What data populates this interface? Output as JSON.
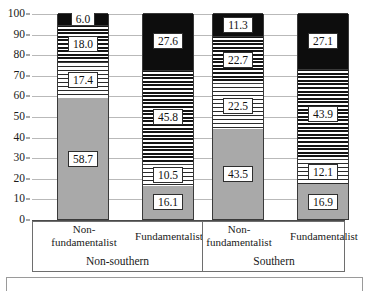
{
  "chart_data": {
    "type": "bar",
    "subtype": "stacked-100-percent",
    "title": "",
    "xlabel": "",
    "ylabel": "",
    "ylim": [
      0,
      100
    ],
    "ytick_step": 10,
    "yticks": [
      "0",
      "10",
      "20",
      "30",
      "40",
      "50",
      "60",
      "70",
      "80",
      "90",
      "100"
    ],
    "grid": true,
    "legend": "none-visible",
    "categories": [
      "Non-fundamentalist",
      "Fundamentalist",
      "Non-fundamentalist",
      "Fundamentalist"
    ],
    "group_labels": [
      "Non-southern",
      "Southern"
    ],
    "series": [
      {
        "name": "segment-1-solid-gray",
        "pattern": "solid-gray",
        "color": "#a9a9a9",
        "values": [
          58.7,
          16.1,
          43.5,
          16.9
        ]
      },
      {
        "name": "segment-2-light-hatch",
        "pattern": "light-hatch",
        "color": "#ffffff",
        "values": [
          17.4,
          10.5,
          22.5,
          12.1
        ]
      },
      {
        "name": "segment-3-dense-hatch",
        "pattern": "dense-hatch",
        "color": "#ffffff",
        "values": [
          18.0,
          45.8,
          22.7,
          43.9
        ]
      },
      {
        "name": "segment-4-solid-black",
        "pattern": "solid-black",
        "color": "#0d0d0d",
        "values": [
          6.0,
          27.6,
          11.3,
          27.1
        ]
      }
    ],
    "bars": [
      {
        "category": "Non-fundamentalist",
        "group": "Non-southern",
        "segments": [
          {
            "label": "58.7",
            "value": 58.7,
            "pattern": "solid-gray"
          },
          {
            "label": "17.4",
            "value": 17.4,
            "pattern": "light-hatch"
          },
          {
            "label": "18.0",
            "value": 18.0,
            "pattern": "dense-hatch"
          },
          {
            "label": "6.0",
            "value": 6.0,
            "pattern": "solid-black"
          }
        ]
      },
      {
        "category": "Fundamentalist",
        "group": "Non-southern",
        "segments": [
          {
            "label": "16.1",
            "value": 16.1,
            "pattern": "solid-gray"
          },
          {
            "label": "10.5",
            "value": 10.5,
            "pattern": "light-hatch"
          },
          {
            "label": "45.8",
            "value": 45.8,
            "pattern": "dense-hatch"
          },
          {
            "label": "27.6",
            "value": 27.6,
            "pattern": "solid-black"
          }
        ]
      },
      {
        "category": "Non-fundamentalist",
        "group": "Southern",
        "segments": [
          {
            "label": "43.5",
            "value": 43.5,
            "pattern": "solid-gray"
          },
          {
            "label": "22.5",
            "value": 22.5,
            "pattern": "light-hatch"
          },
          {
            "label": "22.7",
            "value": 22.7,
            "pattern": "dense-hatch"
          },
          {
            "label": "11.3",
            "value": 11.3,
            "pattern": "solid-black"
          }
        ]
      },
      {
        "category": "Fundamentalist",
        "group": "Southern",
        "segments": [
          {
            "label": "16.9",
            "value": 16.9,
            "pattern": "solid-gray"
          },
          {
            "label": "12.1",
            "value": 12.1,
            "pattern": "light-hatch"
          },
          {
            "label": "43.9",
            "value": 43.9,
            "pattern": "dense-hatch"
          },
          {
            "label": "27.1",
            "value": 27.1,
            "pattern": "solid-black"
          }
        ]
      }
    ]
  },
  "axis": {
    "y_labels": [
      "100",
      "90",
      "80",
      "70",
      "60",
      "50",
      "40",
      "30",
      "20",
      "10",
      "0"
    ]
  },
  "categories_display": [
    {
      "line1": "Non-",
      "line2": "fundamentalist",
      "single": ""
    },
    {
      "line1": "",
      "line2": "",
      "single": "Fundamentalist"
    },
    {
      "line1": "Non-",
      "line2": "fundamentalist",
      "single": ""
    },
    {
      "line1": "",
      "line2": "",
      "single": "Fundamentalist"
    }
  ],
  "groups_display": [
    {
      "label": "Non-southern"
    },
    {
      "label": "Southern"
    }
  ],
  "colors": {
    "solid_gray": "#a9a9a9",
    "solid_black": "#0d0d0d",
    "hatch_fg": "#141414",
    "hatch_bg": "#ffffff",
    "gridline": "#b9b9b9",
    "axis": "#4a4a4a",
    "border": "#3a3a3a"
  }
}
